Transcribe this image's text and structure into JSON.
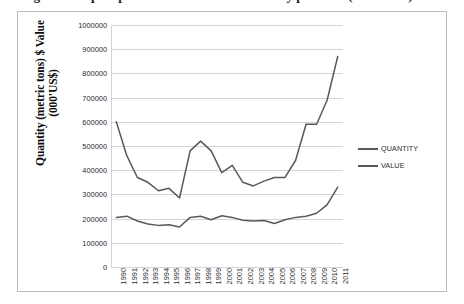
{
  "caption": {
    "text": "Figure 1: Export performance of fish and fishery products (1990-2011)"
  },
  "legend": {
    "position": "right",
    "entries": [
      {
        "label": "QUANTITY",
        "color": "#595959"
      },
      {
        "label": "VALUE",
        "color": "#595959"
      }
    ]
  },
  "axis": {
    "y_title_line1": "Quantity  (metric tons) $ Value",
    "y_title_line2": "(000'US$)",
    "y_ticks": [
      "1000000",
      "900000",
      "800000",
      "700000",
      "600000",
      "500000",
      "400000",
      "300000",
      "200000",
      "100000",
      "0"
    ],
    "x_ticks": [
      "1990",
      "1991",
      "1992",
      "1993",
      "1994",
      "1995",
      "1996",
      "1997",
      "1998",
      "1999",
      "2000",
      "2001",
      "2002",
      "2003",
      "2004",
      "2005",
      "2006",
      "2007",
      "2008",
      "2009",
      "2010",
      "2011"
    ]
  },
  "chart_data": {
    "type": "line",
    "title": "",
    "xlabel": "",
    "ylabel": "Quantity  (metric tons) $ Value (000'US$)",
    "ylim": [
      0,
      1000000
    ],
    "ytick_step": 100000,
    "grid": true,
    "legend_position": "right",
    "x": [
      "1990",
      "1991",
      "1992",
      "1993",
      "1994",
      "1995",
      "1996",
      "1997",
      "1998",
      "1999",
      "2000",
      "2001",
      "2002",
      "2003",
      "2004",
      "2005",
      "2006",
      "2007",
      "2008",
      "2009",
      "2010",
      "2011"
    ],
    "series": [
      {
        "name": "QUANTITY",
        "color": "#595959",
        "values": [
          205000,
          210000,
          190000,
          178000,
          172000,
          175000,
          165000,
          205000,
          210000,
          195000,
          212000,
          205000,
          193000,
          190000,
          192000,
          180000,
          195000,
          205000,
          210000,
          222000,
          258000,
          330000
        ]
      },
      {
        "name": "VALUE",
        "color": "#595959",
        "values": [
          600000,
          460000,
          370000,
          350000,
          315000,
          325000,
          285000,
          480000,
          520000,
          480000,
          390000,
          420000,
          350000,
          335000,
          355000,
          370000,
          370000,
          440000,
          590000,
          590000,
          690000,
          870000
        ]
      }
    ]
  }
}
